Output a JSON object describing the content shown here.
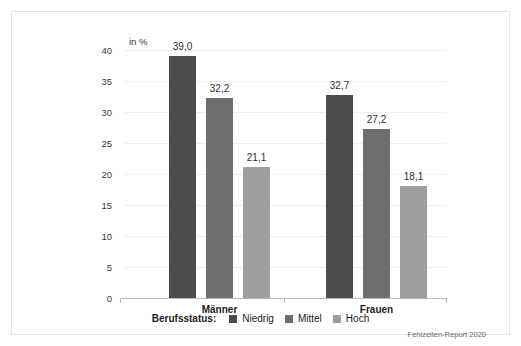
{
  "figure": {
    "unit_label": "in %",
    "source_note": "Fehlzeiten-Report 2020",
    "border_color": "#e2e2e2",
    "background": "#ffffff",
    "gridline_color": "#ededed",
    "axis_color": "#b9b9b9"
  },
  "legend": {
    "title": "Berufsstatus:",
    "items": [
      {
        "label": "Niedrig",
        "color": "#4d4d4d"
      },
      {
        "label": "Mittel",
        "color": "#6e6e6e"
      },
      {
        "label": "Hoch",
        "color": "#9e9e9e"
      }
    ]
  },
  "chart_data": {
    "type": "bar",
    "title": "",
    "subtitle": "",
    "xlabel": "",
    "ylabel": "in %",
    "ylim": [
      0,
      40
    ],
    "yticks": [
      0,
      5,
      10,
      15,
      20,
      25,
      30,
      35,
      40
    ],
    "ytick_labels": [
      "0",
      "5",
      "10",
      "15",
      "20",
      "25",
      "30",
      "35",
      "40"
    ],
    "grid": true,
    "legend_position": "bottom",
    "categories": [
      "Männer",
      "Frauen"
    ],
    "series": [
      {
        "name": "Niedrig",
        "color": "#4d4d4d",
        "values": [
          39.0,
          32.7
        ],
        "labels": [
          "39,0",
          "32,7"
        ]
      },
      {
        "name": "Mittel",
        "color": "#6e6e6e",
        "values": [
          32.2,
          27.2
        ],
        "labels": [
          "32,2",
          "27,2"
        ]
      },
      {
        "name": "Hoch",
        "color": "#9e9e9e",
        "values": [
          21.1,
          18.1
        ],
        "labels": [
          "21,1",
          "18,1"
        ]
      }
    ]
  }
}
